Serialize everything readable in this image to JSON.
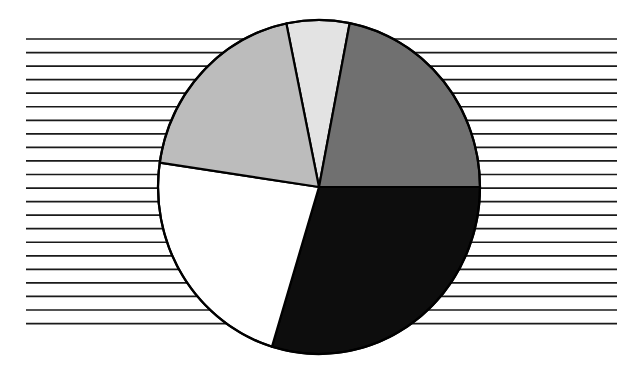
{
  "figure": {
    "width": 639,
    "height": 367,
    "background_color": "#ffffff",
    "title": "",
    "caption": ""
  },
  "chart_data": {
    "type": "pie",
    "title": "",
    "subtitle": "",
    "xlabel": "",
    "ylabel": "",
    "legend": false,
    "legend_position": "none",
    "grid": false,
    "data_labels": false,
    "categories": [
      "Slice 1",
      "Slice 2",
      "Slice 3",
      "Slice 4",
      "Slice 5"
    ],
    "values": [
      6.4,
      22.0,
      29.7,
      22.5,
      19.4
    ],
    "units": "percent",
    "total": 100.0,
    "start_angle_deg": 348.3,
    "direction": "clockwise",
    "slices": [
      {
        "label": "Slice 1",
        "value": 6.4,
        "color": "#e3e3e3",
        "start_angle_deg": 348.3,
        "end_angle_deg": 11.0,
        "sweep_deg": 22.7
      },
      {
        "label": "Slice 2",
        "value": 22.0,
        "color": "#707070",
        "start_angle_deg": 11.0,
        "end_angle_deg": 90.0,
        "sweep_deg": 79.0
      },
      {
        "label": "Slice 3",
        "value": 29.7,
        "color": "#0d0d0d",
        "start_angle_deg": 90.0,
        "end_angle_deg": 197.0,
        "sweep_deg": 107.0
      },
      {
        "label": "Slice 4",
        "value": 22.5,
        "color": "#ffffff",
        "start_angle_deg": 197.0,
        "end_angle_deg": 278.4,
        "sweep_deg": 81.4
      },
      {
        "label": "Slice 5",
        "value": 19.4,
        "color": "#bcbcbc",
        "start_angle_deg": 278.4,
        "end_angle_deg": 348.3,
        "sweep_deg": 69.9
      }
    ],
    "geometry": {
      "center_x": 319,
      "center_y": 187,
      "radius_x": 161,
      "radius_y": 167,
      "outline_color": "#000000",
      "outline_width": 2.2
    },
    "background_hatch": {
      "orientation": "horizontal",
      "line_color": "#1a1a1a",
      "line_width": 1.7,
      "line_count": 22,
      "x_start": 26,
      "x_end": 617,
      "y_first": 39,
      "y_spacing": 13.55,
      "occluded_by_pie": true
    }
  }
}
